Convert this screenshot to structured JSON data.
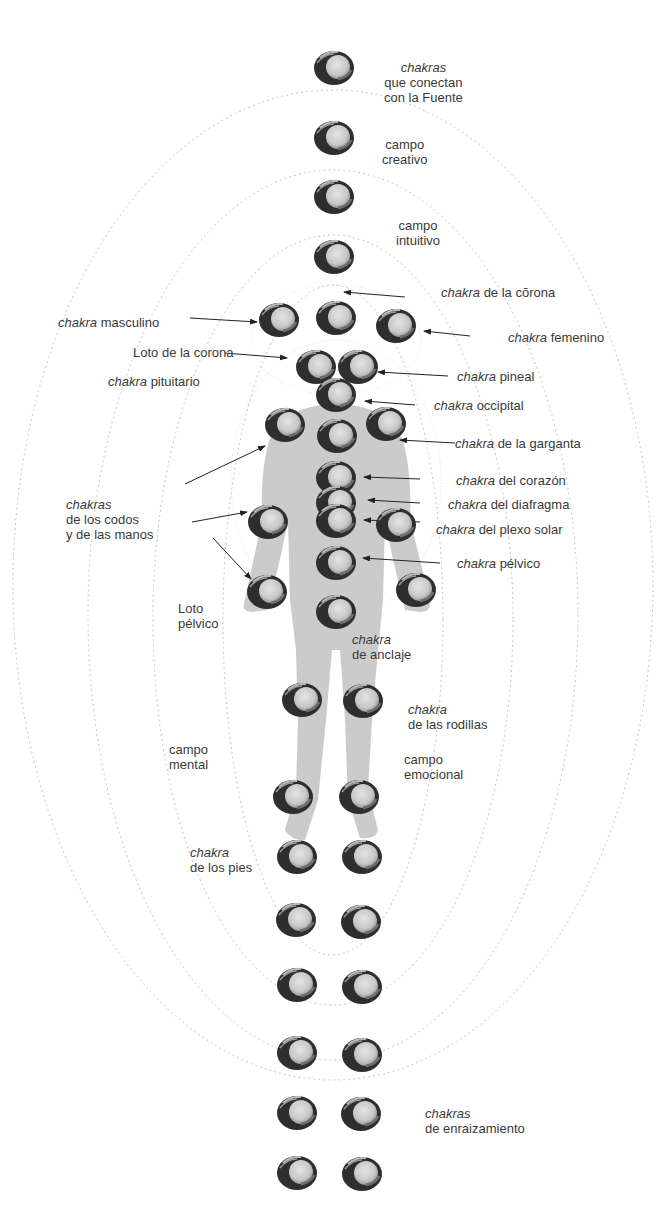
{
  "diagram": {
    "type": "chakra-energy-body-diagram",
    "colors": {
      "background": "#ffffff",
      "body": "#c8c8c8",
      "chakra_dark": "#2e2e2e",
      "chakra_light": "#d6d6d6",
      "field_lines": "#bdbdbd",
      "text": "#3a3a3a"
    },
    "fields": [
      {
        "id": "outer",
        "cx": 333,
        "cy": 585,
        "rx": 320,
        "ry": 495
      },
      {
        "id": "third",
        "cx": 333,
        "cy": 615,
        "rx": 245,
        "ry": 445
      },
      {
        "id": "second",
        "cx": 333,
        "cy": 620,
        "rx": 180,
        "ry": 385
      },
      {
        "id": "inner",
        "cx": 333,
        "cy": 620,
        "rx": 110,
        "ry": 335
      }
    ],
    "chakras": [
      {
        "name": "fuente-1",
        "x": 334,
        "y": 68
      },
      {
        "name": "fuente-2",
        "x": 334,
        "y": 138
      },
      {
        "name": "fuente-3",
        "x": 334,
        "y": 197
      },
      {
        "name": "fuente-4",
        "x": 334,
        "y": 257
      },
      {
        "name": "corona",
        "x": 336,
        "y": 318
      },
      {
        "name": "masculino",
        "x": 279,
        "y": 320
      },
      {
        "name": "femenino",
        "x": 396,
        "y": 326
      },
      {
        "name": "pituitario",
        "x": 316,
        "y": 367
      },
      {
        "name": "pineal",
        "x": 358,
        "y": 367
      },
      {
        "name": "occipital",
        "x": 336,
        "y": 395
      },
      {
        "name": "hombro-izq",
        "x": 285,
        "y": 425
      },
      {
        "name": "garganta",
        "x": 337,
        "y": 436
      },
      {
        "name": "hombro-der",
        "x": 386,
        "y": 424
      },
      {
        "name": "corazon",
        "x": 336,
        "y": 478
      },
      {
        "name": "diafragma",
        "x": 336,
        "y": 503
      },
      {
        "name": "plexo-solar",
        "x": 336,
        "y": 521
      },
      {
        "name": "codo-izq",
        "x": 268,
        "y": 522
      },
      {
        "name": "codo-der",
        "x": 396,
        "y": 525
      },
      {
        "name": "pelvico",
        "x": 336,
        "y": 563
      },
      {
        "name": "mano-izq",
        "x": 267,
        "y": 592
      },
      {
        "name": "mano-der",
        "x": 416,
        "y": 590
      },
      {
        "name": "anclaje",
        "x": 336,
        "y": 612
      },
      {
        "name": "rodilla-izq",
        "x": 302,
        "y": 700
      },
      {
        "name": "rodilla-der",
        "x": 363,
        "y": 701
      },
      {
        "name": "tobillo-izq",
        "x": 293,
        "y": 797
      },
      {
        "name": "tobillo-der",
        "x": 359,
        "y": 797
      },
      {
        "name": "pie-izq",
        "x": 297,
        "y": 857
      },
      {
        "name": "pie-der",
        "x": 362,
        "y": 857
      },
      {
        "name": "enraiz-1-izq",
        "x": 296,
        "y": 920
      },
      {
        "name": "enraiz-1-der",
        "x": 361,
        "y": 922
      },
      {
        "name": "enraiz-2-izq",
        "x": 297,
        "y": 985
      },
      {
        "name": "enraiz-2-der",
        "x": 362,
        "y": 987
      },
      {
        "name": "enraiz-3-izq",
        "x": 297,
        "y": 1053
      },
      {
        "name": "enraiz-3-der",
        "x": 362,
        "y": 1055
      },
      {
        "name": "enraiz-4-izq",
        "x": 297,
        "y": 1113
      },
      {
        "name": "enraiz-4-der",
        "x": 361,
        "y": 1114
      },
      {
        "name": "enraiz-5-izq",
        "x": 297,
        "y": 1173
      },
      {
        "name": "enraiz-5-der",
        "x": 362,
        "y": 1174
      }
    ],
    "arrows": [
      {
        "from": [
          405,
          297
        ],
        "to": [
          344,
          292
        ]
      },
      {
        "from": [
          190,
          318
        ],
        "to": [
          257,
          322
        ]
      },
      {
        "from": [
          470,
          336
        ],
        "to": [
          424,
          331
        ]
      },
      {
        "from": [
          225,
          353
        ],
        "to": [
          287,
          358
        ]
      },
      {
        "from": [
          448,
          376
        ],
        "to": [
          378,
          372
        ]
      },
      {
        "from": [
          415,
          405
        ],
        "to": [
          365,
          401
        ]
      },
      {
        "from": [
          455,
          443
        ],
        "to": [
          400,
          440
        ]
      },
      {
        "from": [
          185,
          484
        ],
        "to": [
          265,
          446
        ]
      },
      {
        "from": [
          420,
          479
        ],
        "to": [
          364,
          477
        ]
      },
      {
        "from": [
          420,
          503
        ],
        "to": [
          368,
          500
        ]
      },
      {
        "from": [
          420,
          522
        ],
        "to": [
          364,
          520
        ]
      },
      {
        "from": [
          192,
          522
        ],
        "to": [
          247,
          512
        ]
      },
      {
        "from": [
          213,
          538
        ],
        "to": [
          251,
          579
        ]
      },
      {
        "from": [
          440,
          563
        ],
        "to": [
          363,
          558
        ]
      }
    ]
  },
  "labels": {
    "fuente": {
      "italic": "chakras",
      "line2": "que conectan",
      "line3": "con la Fuente"
    },
    "creativo": {
      "line1": "campo",
      "line2": "creativo"
    },
    "intuitivo": {
      "line1": "campo",
      "line2": "intuitivo"
    },
    "corona": {
      "italic": "chakra",
      "rest": " de la cŏrona"
    },
    "masculino": {
      "italic": "chakra",
      "rest": " masculino"
    },
    "femenino": {
      "italic": "chakra",
      "rest": " femenino"
    },
    "loto_corona": {
      "text": "Loto de la corona"
    },
    "pituitario": {
      "italic": "chakra",
      "rest": " pituitario"
    },
    "pineal": {
      "italic": "chakra",
      "rest": " pineal"
    },
    "occipital": {
      "italic": "chakra",
      "rest": " occipital"
    },
    "garganta": {
      "italic": "chakra",
      "rest": " de la garganta"
    },
    "corazon": {
      "italic": "chakra",
      "rest": " del corazón"
    },
    "diafragma": {
      "italic": "chakra",
      "rest": " del diafragma"
    },
    "plexo": {
      "italic": "chakra",
      "rest": " del plexo solar"
    },
    "pelvico": {
      "italic": "chakra",
      "rest": " pélvico"
    },
    "codos": {
      "italic": "chakras",
      "line2": "de los codos",
      "line3": "y de las manos"
    },
    "loto_pelvico": {
      "line1": "Loto",
      "line2": "pélvico"
    },
    "anclaje": {
      "italic": "chakra",
      "line2": "de anclaje"
    },
    "rodillas": {
      "italic": "chakra",
      "line2": "de las rodillas"
    },
    "mental": {
      "line1": "campo",
      "line2": "mental"
    },
    "emocional": {
      "line1": "campo",
      "line2": "emocional"
    },
    "pies": {
      "italic": "chakra",
      "line2": "de los pies"
    },
    "enraizamiento": {
      "italic": "chakras",
      "line2": "de enraizamiento"
    }
  }
}
